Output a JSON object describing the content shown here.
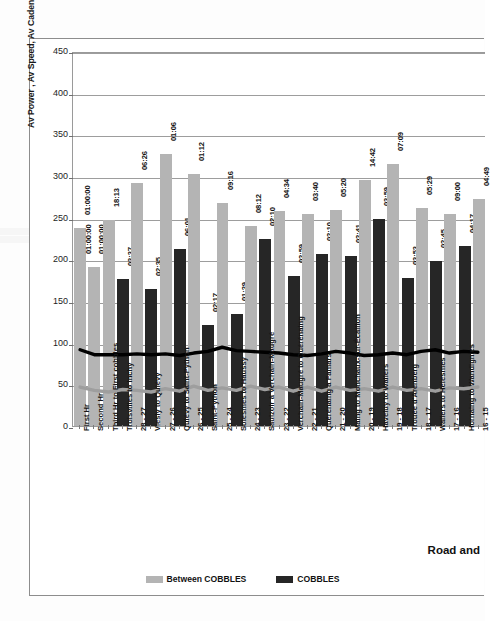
{
  "chart_title": "Per Section",
  "axis_caption": "Road and",
  "y_axis_title": "Av Power , Av Speed, Av Cadence Per Section",
  "legend": [
    {
      "label": "Between COBBLES",
      "color": "#b4b4b4",
      "key": "between"
    },
    {
      "label": "COBBLES",
      "color": "#262626",
      "key": "cobbles"
    }
  ],
  "chart_data": {
    "type": "bar",
    "title": "Per Section",
    "xlabel": "Road and",
    "ylabel": "Av Power , Av Speed, Av Cadence Per Section",
    "ylim": [
      0,
      450
    ],
    "yticks": [
      0,
      50,
      100,
      150,
      200,
      250,
      300,
      350,
      400,
      450
    ],
    "grid": true,
    "legend_position": "bottom-center",
    "categories": [
      "First Hr",
      "Second Hr",
      "Third Hr to First cobbles",
      "Troisvilles to Inchy",
      "28 - 27",
      "Viesly to Quiévy",
      "27 - 26",
      "Quiévy to Saint-Python",
      "26 - 25",
      "Saint-Python",
      "25 - 24",
      "Solesmes to Haussy",
      "24 - 23",
      "Saulzoir à Verchain-Maugré",
      "23 - 22",
      "Verchain-Maugré to Quérénaing",
      "22 - 21",
      "Quérénaing à Famars",
      "21 - 20",
      "Maing to Monchaux-sur-Écaillon",
      "20  -  19",
      "Haveluy to Wallers",
      "19  -  18",
      "Trouée d'Arenberg",
      "18  -  17",
      "Wallers to Hélesmes",
      "17  -  16",
      "Hornaing to Wandignies",
      "16  -  15"
    ],
    "series": [
      {
        "name": "Between COBBLES",
        "type": "bar",
        "color": "#b4b4b4",
        "values": [
          238,
          191,
          247,
          null,
          292,
          null,
          326,
          null,
          302,
          null,
          268,
          null,
          240,
          null,
          258,
          null,
          254,
          null,
          259,
          null,
          295,
          null,
          315,
          null,
          262,
          null,
          255,
          null,
          272
        ]
      },
      {
        "name": "COBBLES",
        "type": "bar",
        "color": "#262626",
        "values": [
          null,
          null,
          null,
          177,
          null,
          164,
          null,
          212,
          null,
          121,
          null,
          134,
          null,
          224,
          null,
          180,
          null,
          206,
          null,
          204,
          null,
          249,
          null,
          178,
          null,
          198,
          null,
          216,
          null
        ]
      },
      {
        "name": "Av Power",
        "type": "line",
        "color": "#000000",
        "values": [
          92,
          86,
          86,
          86,
          87,
          86,
          87,
          85,
          88,
          90,
          95,
          91,
          90,
          89,
          88,
          86,
          85,
          87,
          90,
          88,
          85,
          86,
          88,
          86,
          90,
          92,
          88,
          90,
          89
        ]
      },
      {
        "name": "Av Speed",
        "type": "line",
        "color": "#9e9e9e",
        "values": [
          47,
          43,
          41,
          44,
          43,
          41,
          45,
          42,
          48,
          43,
          46,
          43,
          48,
          44,
          47,
          42,
          47,
          42,
          47,
          43,
          45,
          42,
          47,
          43,
          45,
          42,
          46,
          45,
          47
        ]
      }
    ],
    "bar_labels": [
      {
        "index": 0,
        "series": "Between COBBLES",
        "text": "01:00:00"
      },
      {
        "index": 0,
        "series": "COBBLES",
        "text": "01:00:00"
      },
      {
        "index": 1,
        "series": "Between COBBLES",
        "text": "01:00:00"
      },
      {
        "index": 2,
        "series": "Between COBBLES",
        "text": "18:13"
      },
      {
        "index": 3,
        "series": "COBBLES",
        "text": "03:37"
      },
      {
        "index": 4,
        "series": "Between COBBLES",
        "text": "06:26"
      },
      {
        "index": 5,
        "series": "COBBLES",
        "text": "02:35"
      },
      {
        "index": 6,
        "series": "Between COBBLES",
        "text": "01:06"
      },
      {
        "index": 7,
        "series": "COBBLES",
        "text": "06:01"
      },
      {
        "index": 8,
        "series": "Between COBBLES",
        "text": "01:12"
      },
      {
        "index": 9,
        "series": "COBBLES",
        "text": "02:17"
      },
      {
        "index": 10,
        "series": "Between COBBLES",
        "text": "09:16"
      },
      {
        "index": 11,
        "series": "COBBLES",
        "text": "01:29"
      },
      {
        "index": 12,
        "series": "Between COBBLES",
        "text": "08:12"
      },
      {
        "index": 13,
        "series": "COBBLES",
        "text": "02:10"
      },
      {
        "index": 14,
        "series": "Between COBBLES",
        "text": "04:34"
      },
      {
        "index": 15,
        "series": "COBBLES",
        "text": "02:59"
      },
      {
        "index": 16,
        "series": "Between COBBLES",
        "text": "03:40"
      },
      {
        "index": 17,
        "series": "COBBLES",
        "text": "02:10"
      },
      {
        "index": 18,
        "series": "Between COBBLES",
        "text": "05:20"
      },
      {
        "index": 19,
        "series": "COBBLES",
        "text": "02:41"
      },
      {
        "index": 20,
        "series": "Between COBBLES",
        "text": "14:42"
      },
      {
        "index": 21,
        "series": "COBBLES",
        "text": "03:59"
      },
      {
        "index": 22,
        "series": "Between COBBLES",
        "text": "07:09"
      },
      {
        "index": 23,
        "series": "COBBLES",
        "text": "03:53"
      },
      {
        "index": 24,
        "series": "Between COBBLES",
        "text": "05:29"
      },
      {
        "index": 25,
        "series": "COBBLES",
        "text": "02:45"
      },
      {
        "index": 26,
        "series": "Between COBBLES",
        "text": "09:00"
      },
      {
        "index": 27,
        "series": "COBBLES",
        "text": "04:17"
      },
      {
        "index": 28,
        "series": "Between COBBLES",
        "text": "04:49"
      }
    ]
  }
}
